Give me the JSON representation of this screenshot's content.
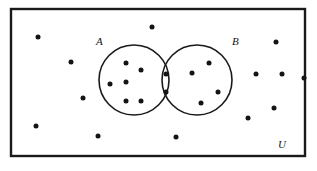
{
  "figure": {
    "kind": "venn-diagram",
    "caption": "",
    "background_color": "#ffffff",
    "stroke_color": "#1a1a1a",
    "dot_color": "#141414",
    "width": 317,
    "height": 171
  },
  "universe": {
    "label": "U",
    "label_x": 278,
    "label_y": 148,
    "rect": {
      "x": 11,
      "y": 9,
      "width": 294,
      "height": 147
    },
    "stroke_width": 2.4
  },
  "sets": [
    {
      "name": "set-a",
      "label": "A",
      "label_x": 96,
      "label_y": 45,
      "cx": 134,
      "cy": 80,
      "r": 35,
      "stroke_width": 1.6
    },
    {
      "name": "set-b",
      "label": "B",
      "label_x": 232,
      "label_y": 45,
      "cx": 197,
      "cy": 80,
      "r": 35,
      "stroke_width": 1.6
    }
  ],
  "chart_data": {
    "type": "scatter",
    "title": "",
    "xlabel": "",
    "ylabel": "",
    "regions": {
      "a_only_count": 6,
      "intersection_count": 2,
      "b_only_count": 4,
      "outside_count": 13,
      "total_count": 25
    },
    "dot_radius": 2.5,
    "points": [
      {
        "id": "a1",
        "region": "a-only",
        "x": 126,
        "y": 63
      },
      {
        "id": "a2",
        "region": "a-only",
        "x": 141,
        "y": 70
      },
      {
        "id": "a3",
        "region": "a-only",
        "x": 110,
        "y": 84
      },
      {
        "id": "a4",
        "region": "a-only",
        "x": 126,
        "y": 82
      },
      {
        "id": "a5",
        "region": "a-only",
        "x": 126,
        "y": 101
      },
      {
        "id": "a6",
        "region": "a-only",
        "x": 141,
        "y": 101
      },
      {
        "id": "i1",
        "region": "intersection",
        "x": 166,
        "y": 74
      },
      {
        "id": "i2",
        "region": "intersection",
        "x": 166,
        "y": 92
      },
      {
        "id": "b1",
        "region": "b-only",
        "x": 209,
        "y": 63
      },
      {
        "id": "b2",
        "region": "b-only",
        "x": 192,
        "y": 73
      },
      {
        "id": "b3",
        "region": "b-only",
        "x": 218,
        "y": 92
      },
      {
        "id": "b4",
        "region": "b-only",
        "x": 201,
        "y": 103
      },
      {
        "id": "o1",
        "region": "outside",
        "x": 152,
        "y": 27
      },
      {
        "id": "o2",
        "region": "outside",
        "x": 38,
        "y": 37
      },
      {
        "id": "o3",
        "region": "outside",
        "x": 71,
        "y": 62
      },
      {
        "id": "o4",
        "region": "outside",
        "x": 83,
        "y": 98
      },
      {
        "id": "o5",
        "region": "outside",
        "x": 36,
        "y": 126
      },
      {
        "id": "o6",
        "region": "outside",
        "x": 98,
        "y": 136
      },
      {
        "id": "o7",
        "region": "outside",
        "x": 176,
        "y": 137
      },
      {
        "id": "o8",
        "region": "outside",
        "x": 276,
        "y": 42
      },
      {
        "id": "o9",
        "region": "outside",
        "x": 256,
        "y": 74
      },
      {
        "id": "o10",
        "region": "outside",
        "x": 282,
        "y": 74
      },
      {
        "id": "o11",
        "region": "outside",
        "x": 274,
        "y": 108
      },
      {
        "id": "o12",
        "region": "outside",
        "x": 248,
        "y": 118
      },
      {
        "id": "o13",
        "region": "outside",
        "x": 304,
        "y": 78
      }
    ]
  }
}
